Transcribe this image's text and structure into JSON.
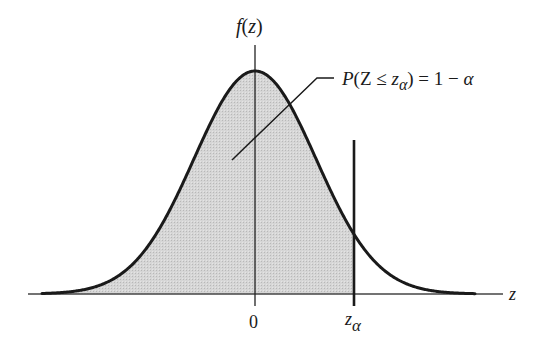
{
  "figure": {
    "type": "normal-distribution-diagram",
    "y_axis_label": "f(z)",
    "x_axis_label": "z",
    "tick_labels": {
      "center": "0",
      "critical": {
        "base": "z",
        "subscript": "α"
      }
    },
    "annotation": {
      "parts": [
        "P(Z ≤ z",
        "α",
        ") = 1 − α"
      ],
      "full_text": "P(Z ≤ zα) = 1 − α"
    },
    "shaded_region": "area under curve left of z_alpha",
    "colors": {
      "curve": "#1a1a1a",
      "axis": "#333333",
      "fill": "#cfcfcf",
      "background": "#ffffff"
    }
  },
  "chart_data": {
    "type": "area",
    "title": "",
    "xlabel": "z",
    "ylabel": "f(z)",
    "distribution": "standard normal",
    "mean": 0,
    "std": 1,
    "critical_value_label": "z_α",
    "critical_value_approx": 1.62,
    "shaded": "z ≤ z_α",
    "shaded_area_label": "P(Z ≤ z_α) = 1 − α",
    "x_ticks": [
      "0",
      "z_α"
    ],
    "grid": false,
    "legend": false
  }
}
